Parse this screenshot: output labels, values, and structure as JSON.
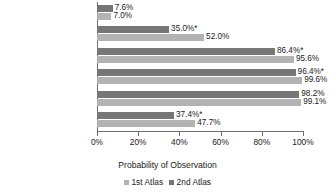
{
  "chart_data": {
    "type": "bar",
    "orientation": "horizontal",
    "title": "",
    "xlabel": "Probability of Observation",
    "ylabel": "",
    "xlim": [
      0,
      100
    ],
    "xticks": [
      "0%",
      "20%",
      "40%",
      "60%",
      "80%",
      "100%"
    ],
    "xtick_values": [
      0,
      20,
      40,
      60,
      80,
      100
    ],
    "grid": false,
    "legend_position": "bottom",
    "categories": [
      "Hudson Bay Lowlands",
      "Northern Shield",
      "Southern Shield",
      "Lake Simcoe-Rideau",
      "Carolinian",
      "Ontario"
    ],
    "series": [
      {
        "name": "2nd Atlas",
        "color": "#767676",
        "values": [
          7.6,
          35.0,
          86.4,
          96.4,
          98.2,
          37.4
        ],
        "labels": [
          "7.6%",
          "35.0%*",
          "86.4%*",
          "96.4%*",
          "98.2%",
          "37.4%*"
        ]
      },
      {
        "name": "1st Atlas",
        "color": "#b3b3b3",
        "values": [
          7.0,
          52.0,
          95.6,
          99.6,
          99.1,
          47.7
        ],
        "labels": [
          "7.0%",
          "52.0%",
          "95.6%",
          "99.6%",
          "99.1%",
          "47.7%"
        ]
      }
    ],
    "legend": [
      "1st Atlas",
      "2nd Atlas"
    ],
    "annotation": "* marks values flagged with an asterisk"
  }
}
